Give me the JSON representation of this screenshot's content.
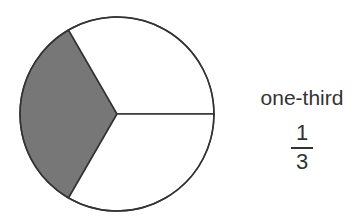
{
  "diagram": {
    "type": "fraction-circle",
    "total_parts": 3,
    "shaded_parts": 1,
    "shaded_color": "#777777",
    "unshaded_color": "#ffffff",
    "stroke_color": "#333333"
  },
  "label": {
    "words": "one-third",
    "numerator": "1",
    "denominator": "3"
  }
}
